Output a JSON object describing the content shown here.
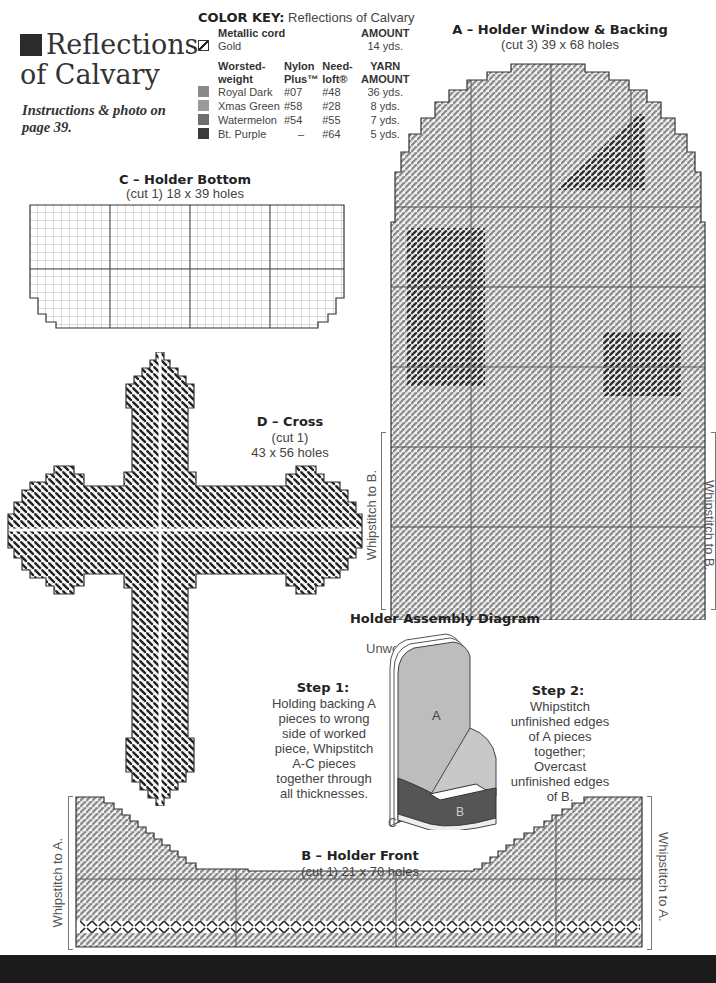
{
  "title": {
    "line1": "Reflections",
    "line2": "of Calvary",
    "instructions": "Instructions & photo on page 39."
  },
  "color_key": {
    "label": "COLOR KEY:",
    "pattern_name": "Reflections of Calvary",
    "metallic": {
      "header": "Metallic cord",
      "amount_header": "AMOUNT",
      "items": [
        {
          "name": "Gold",
          "amount": "14 yds.",
          "icon": "slash-swatch-icon"
        }
      ]
    },
    "yarn": {
      "headers": [
        "Worsted-weight",
        "Nylon Plus™",
        "Need-loft®",
        "YARN AMOUNT"
      ],
      "items": [
        {
          "name": "Royal Dark",
          "nylon": "#07",
          "needloft": "#48",
          "amount": "36 yds.",
          "color": "#8a8a8a"
        },
        {
          "name": "Xmas Green",
          "nylon": "#58",
          "needloft": "#28",
          "amount": "8 yds.",
          "color": "#9a9a9a"
        },
        {
          "name": "Watermelon",
          "nylon": "#54",
          "needloft": "#55",
          "amount": "7 yds.",
          "color": "#6e6e6e"
        },
        {
          "name": "Bt. Purple",
          "nylon": "–",
          "needloft": "#64",
          "amount": "5 yds.",
          "color": "#3a3a3a"
        }
      ]
    }
  },
  "pieces": {
    "a": {
      "title": "A – Holder Window & Backing",
      "sub": "(cut 3) 39 x 68 holes",
      "left_label": "Whipstitch to B.",
      "right_label": "Whipstitch to B."
    },
    "c": {
      "title": "C – Holder Bottom",
      "sub": "(cut 1) 18 x 39 holes"
    },
    "d": {
      "title": "D – Cross",
      "sub1": "(cut 1)",
      "sub2": "43 x 56 holes"
    },
    "b": {
      "title": "B – Holder Front",
      "sub": "(cut 1) 21 x 70 holes",
      "left_label": "Whipstitch to A.",
      "right_label": "Whipstitch to A."
    }
  },
  "assembly": {
    "title": "Holder Assembly Diagram",
    "unworked_label": "Unworked A",
    "label_a": "A",
    "label_b": "B",
    "label_c": "C",
    "step1": {
      "title": "Step 1:",
      "text": "Holding backing A pieces to wrong side of worked piece, Whipstitch A-C pieces together through all thicknesses."
    },
    "step2": {
      "title": "Step 2:",
      "text": "Whipstitch unfinished edges of A pieces together; Overcast unfinished edges of B."
    }
  }
}
